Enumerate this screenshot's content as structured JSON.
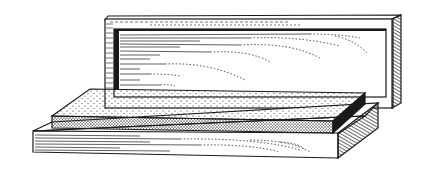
{
  "illustration": {
    "subject": "Sharpening stone on wooden base with open wooden box lid",
    "style": "black-and-white engraving line drawing",
    "colors": {
      "ink": "#1a1a1a",
      "paper": "#ffffff"
    },
    "parts": [
      {
        "name": "box-lid",
        "description": "upright wooden lid with wood-grain hatching"
      },
      {
        "name": "whetstone",
        "description": "rectangular stippled sharpening stone"
      },
      {
        "name": "wooden-base",
        "description": "wooden base tray with wood-grain lines"
      }
    ]
  }
}
